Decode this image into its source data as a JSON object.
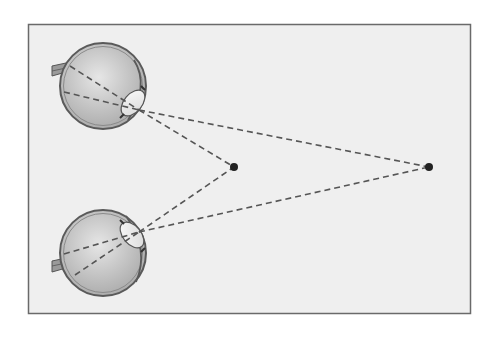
{
  "diagram": {
    "type": "binocular-vision-convergence",
    "colors": {
      "page_background": "#ffffff",
      "panel_background": "#efefef",
      "panel_border": "#6a6a6a",
      "eye_fill_light": "#e2e2e2",
      "eye_fill_dark": "#a9a9a9",
      "eye_outline": "#5a5a5a",
      "lens_fill": "#f4f4f4",
      "dash_line": "#555555",
      "point": "#222222"
    },
    "eyes": [
      {
        "id": "upper-eye",
        "center": [
          103,
          86
        ],
        "radius": 43,
        "facing": "right-down"
      },
      {
        "id": "lower-eye",
        "center": [
          103,
          253
        ],
        "radius": 43,
        "facing": "right-up"
      }
    ],
    "points": [
      {
        "id": "near-point",
        "x": 234,
        "y": 167
      },
      {
        "id": "far-point",
        "x": 429,
        "y": 167
      }
    ]
  }
}
